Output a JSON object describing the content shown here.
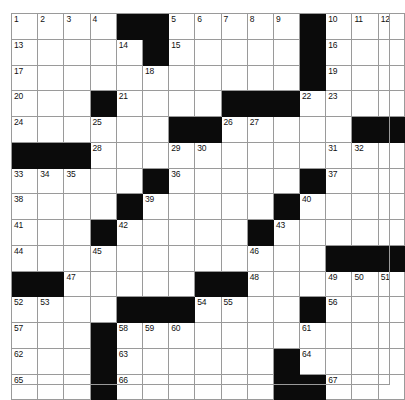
{
  "puzzle": {
    "type": "crossword-grid",
    "title": "",
    "rows": 15,
    "columns": 15,
    "cell_colors": {
      "open": "#ffffff",
      "block": "#0b0b0b",
      "grid_line": "#9a9a9a",
      "number_text": "#111111",
      "background": "#ffffff"
    },
    "max_clue_number": 67,
    "grid": [
      [
        {
          "block": false,
          "number": "1"
        },
        {
          "block": false,
          "number": "2"
        },
        {
          "block": false,
          "number": "3"
        },
        {
          "block": false,
          "number": "4"
        },
        {
          "block": true,
          "number": ""
        },
        {
          "block": true,
          "number": ""
        },
        {
          "block": false,
          "number": "5"
        },
        {
          "block": false,
          "number": "6"
        },
        {
          "block": false,
          "number": "7"
        },
        {
          "block": false,
          "number": "8"
        },
        {
          "block": false,
          "number": "9"
        },
        {
          "block": true,
          "number": ""
        },
        {
          "block": false,
          "number": "10"
        },
        {
          "block": false,
          "number": "11"
        },
        {
          "block": false,
          "number": "12"
        }
      ],
      [
        {
          "block": false,
          "number": "13"
        },
        {
          "block": false,
          "number": ""
        },
        {
          "block": false,
          "number": ""
        },
        {
          "block": false,
          "number": ""
        },
        {
          "block": false,
          "number": "14"
        },
        {
          "block": true,
          "number": ""
        },
        {
          "block": false,
          "number": "15"
        },
        {
          "block": false,
          "number": ""
        },
        {
          "block": false,
          "number": ""
        },
        {
          "block": false,
          "number": ""
        },
        {
          "block": false,
          "number": ""
        },
        {
          "block": true,
          "number": ""
        },
        {
          "block": false,
          "number": "16"
        },
        {
          "block": false,
          "number": ""
        },
        {
          "block": false,
          "number": ""
        }
      ],
      [
        {
          "block": false,
          "number": "17"
        },
        {
          "block": false,
          "number": ""
        },
        {
          "block": false,
          "number": ""
        },
        {
          "block": false,
          "number": ""
        },
        {
          "block": false,
          "number": ""
        },
        {
          "block": false,
          "number": "18"
        },
        {
          "block": false,
          "number": ""
        },
        {
          "block": false,
          "number": ""
        },
        {
          "block": false,
          "number": ""
        },
        {
          "block": false,
          "number": ""
        },
        {
          "block": false,
          "number": ""
        },
        {
          "block": true,
          "number": ""
        },
        {
          "block": false,
          "number": "19"
        },
        {
          "block": false,
          "number": ""
        },
        {
          "block": false,
          "number": ""
        }
      ],
      [
        {
          "block": false,
          "number": "20"
        },
        {
          "block": false,
          "number": ""
        },
        {
          "block": false,
          "number": ""
        },
        {
          "block": true,
          "number": ""
        },
        {
          "block": false,
          "number": "21"
        },
        {
          "block": false,
          "number": ""
        },
        {
          "block": false,
          "number": ""
        },
        {
          "block": false,
          "number": ""
        },
        {
          "block": true,
          "number": ""
        },
        {
          "block": true,
          "number": ""
        },
        {
          "block": true,
          "number": ""
        },
        {
          "block": false,
          "number": "22"
        },
        {
          "block": false,
          "number": "23"
        },
        {
          "block": false,
          "number": ""
        },
        {
          "block": false,
          "number": ""
        }
      ],
      [
        {
          "block": false,
          "number": "24"
        },
        {
          "block": false,
          "number": ""
        },
        {
          "block": false,
          "number": ""
        },
        {
          "block": false,
          "number": "25"
        },
        {
          "block": false,
          "number": ""
        },
        {
          "block": false,
          "number": ""
        },
        {
          "block": true,
          "number": ""
        },
        {
          "block": true,
          "number": ""
        },
        {
          "block": false,
          "number": "26"
        },
        {
          "block": false,
          "number": "27"
        },
        {
          "block": false,
          "number": ""
        },
        {
          "block": false,
          "number": ""
        },
        {
          "block": false,
          "number": ""
        },
        {
          "block": true,
          "number": ""
        },
        {
          "block": true,
          "number": ""
        }
      ],
      [
        {
          "block": true,
          "number": ""
        },
        {
          "block": true,
          "number": ""
        },
        {
          "block": true,
          "number": ""
        },
        {
          "block": false,
          "number": "28"
        },
        {
          "block": false,
          "number": ""
        },
        {
          "block": false,
          "number": ""
        },
        {
          "block": false,
          "number": "29"
        },
        {
          "block": false,
          "number": "30"
        },
        {
          "block": false,
          "number": ""
        },
        {
          "block": false,
          "number": ""
        },
        {
          "block": false,
          "number": ""
        },
        {
          "block": false,
          "number": ""
        },
        {
          "block": false,
          "number": "31"
        },
        {
          "block": false,
          "number": "32"
        },
        {
          "block": false,
          "number": ""
        }
      ],
      [
        {
          "block": false,
          "number": "33"
        },
        {
          "block": false,
          "number": "34"
        },
        {
          "block": false,
          "number": "35"
        },
        {
          "block": false,
          "number": ""
        },
        {
          "block": false,
          "number": ""
        },
        {
          "block": true,
          "number": ""
        },
        {
          "block": false,
          "number": "36"
        },
        {
          "block": false,
          "number": ""
        },
        {
          "block": false,
          "number": ""
        },
        {
          "block": false,
          "number": ""
        },
        {
          "block": false,
          "number": ""
        },
        {
          "block": true,
          "number": ""
        },
        {
          "block": false,
          "number": "37"
        },
        {
          "block": false,
          "number": ""
        },
        {
          "block": false,
          "number": ""
        }
      ],
      [
        {
          "block": false,
          "number": "38"
        },
        {
          "block": false,
          "number": ""
        },
        {
          "block": false,
          "number": ""
        },
        {
          "block": false,
          "number": ""
        },
        {
          "block": true,
          "number": ""
        },
        {
          "block": false,
          "number": "39"
        },
        {
          "block": false,
          "number": ""
        },
        {
          "block": false,
          "number": ""
        },
        {
          "block": false,
          "number": ""
        },
        {
          "block": false,
          "number": ""
        },
        {
          "block": true,
          "number": ""
        },
        {
          "block": false,
          "number": "40"
        },
        {
          "block": false,
          "number": ""
        },
        {
          "block": false,
          "number": ""
        },
        {
          "block": false,
          "number": ""
        }
      ],
      [
        {
          "block": false,
          "number": "41"
        },
        {
          "block": false,
          "number": ""
        },
        {
          "block": false,
          "number": ""
        },
        {
          "block": true,
          "number": ""
        },
        {
          "block": false,
          "number": "42"
        },
        {
          "block": false,
          "number": ""
        },
        {
          "block": false,
          "number": ""
        },
        {
          "block": false,
          "number": ""
        },
        {
          "block": false,
          "number": ""
        },
        {
          "block": true,
          "number": ""
        },
        {
          "block": false,
          "number": "43"
        },
        {
          "block": false,
          "number": ""
        },
        {
          "block": false,
          "number": ""
        },
        {
          "block": false,
          "number": ""
        },
        {
          "block": false,
          "number": ""
        }
      ],
      [
        {
          "block": false,
          "number": "44"
        },
        {
          "block": false,
          "number": ""
        },
        {
          "block": false,
          "number": ""
        },
        {
          "block": false,
          "number": "45"
        },
        {
          "block": false,
          "number": ""
        },
        {
          "block": false,
          "number": ""
        },
        {
          "block": false,
          "number": ""
        },
        {
          "block": false,
          "number": ""
        },
        {
          "block": false,
          "number": ""
        },
        {
          "block": false,
          "number": "46"
        },
        {
          "block": false,
          "number": ""
        },
        {
          "block": false,
          "number": ""
        },
        {
          "block": true,
          "number": ""
        },
        {
          "block": true,
          "number": ""
        },
        {
          "block": true,
          "number": ""
        }
      ],
      [
        {
          "block": true,
          "number": ""
        },
        {
          "block": true,
          "number": ""
        },
        {
          "block": false,
          "number": "47"
        },
        {
          "block": false,
          "number": ""
        },
        {
          "block": false,
          "number": ""
        },
        {
          "block": false,
          "number": ""
        },
        {
          "block": false,
          "number": ""
        },
        {
          "block": true,
          "number": ""
        },
        {
          "block": true,
          "number": ""
        },
        {
          "block": false,
          "number": "48"
        },
        {
          "block": false,
          "number": ""
        },
        {
          "block": false,
          "number": ""
        },
        {
          "block": false,
          "number": "49"
        },
        {
          "block": false,
          "number": "50"
        },
        {
          "block": false,
          "number": "51"
        }
      ],
      [
        {
          "block": false,
          "number": "52"
        },
        {
          "block": false,
          "number": "53"
        },
        {
          "block": false,
          "number": ""
        },
        {
          "block": false,
          "number": ""
        },
        {
          "block": true,
          "number": ""
        },
        {
          "block": true,
          "number": ""
        },
        {
          "block": true,
          "number": ""
        },
        {
          "block": false,
          "number": "54"
        },
        {
          "block": false,
          "number": "55"
        },
        {
          "block": false,
          "number": ""
        },
        {
          "block": false,
          "number": ""
        },
        {
          "block": true,
          "number": ""
        },
        {
          "block": false,
          "number": "56"
        },
        {
          "block": false,
          "number": ""
        },
        {
          "block": false,
          "number": ""
        }
      ],
      [
        {
          "block": false,
          "number": "57"
        },
        {
          "block": false,
          "number": ""
        },
        {
          "block": false,
          "number": ""
        },
        {
          "block": true,
          "number": ""
        },
        {
          "block": false,
          "number": "58"
        },
        {
          "block": false,
          "number": "59"
        },
        {
          "block": false,
          "number": "60"
        },
        {
          "block": false,
          "number": ""
        },
        {
          "block": false,
          "number": ""
        },
        {
          "block": false,
          "number": ""
        },
        {
          "block": false,
          "number": ""
        },
        {
          "block": false,
          "number": "61"
        },
        {
          "block": false,
          "number": ""
        },
        {
          "block": false,
          "number": ""
        },
        {
          "block": false,
          "number": ""
        }
      ],
      [
        {
          "block": false,
          "number": "62"
        },
        {
          "block": false,
          "number": ""
        },
        {
          "block": false,
          "number": ""
        },
        {
          "block": true,
          "number": ""
        },
        {
          "block": false,
          "number": "63"
        },
        {
          "block": false,
          "number": ""
        },
        {
          "block": false,
          "number": ""
        },
        {
          "block": false,
          "number": ""
        },
        {
          "block": false,
          "number": ""
        },
        {
          "block": false,
          "number": ""
        },
        {
          "block": true,
          "number": ""
        },
        {
          "block": false,
          "number": "64"
        },
        {
          "block": false,
          "number": ""
        },
        {
          "block": false,
          "number": ""
        },
        {
          "block": false,
          "number": ""
        }
      ],
      [
        {
          "block": false,
          "number": "65"
        },
        {
          "block": false,
          "number": ""
        },
        {
          "block": false,
          "number": ""
        },
        {
          "block": true,
          "number": ""
        },
        {
          "block": false,
          "number": "66"
        },
        {
          "block": false,
          "number": ""
        },
        {
          "block": false,
          "number": ""
        },
        {
          "block": false,
          "number": ""
        },
        {
          "block": false,
          "number": ""
        },
        {
          "block": false,
          "number": ""
        },
        {
          "block": true,
          "number": ""
        },
        {
          "block": true,
          "number": ""
        },
        {
          "block": false,
          "number": "67"
        },
        {
          "block": false,
          "number": ""
        },
        {
          "block": false,
          "number": ""
        }
      ]
    ]
  }
}
